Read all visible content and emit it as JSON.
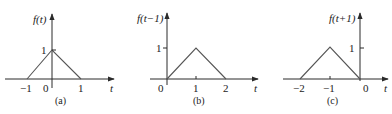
{
  "panels": [
    {
      "id": "a",
      "function_label": "f(t)",
      "axis_variable": "t",
      "caption": "(a)",
      "x_ticks": [
        "−1",
        "0",
        "1"
      ],
      "y_ticks": [
        "1"
      ],
      "vertices": [
        [
          -1,
          0
        ],
        [
          0,
          1
        ],
        [
          1,
          0
        ]
      ]
    },
    {
      "id": "b",
      "function_label": "f(t−1)",
      "axis_variable": "t",
      "caption": "(b)",
      "x_ticks": [
        "0",
        "1",
        "2"
      ],
      "y_ticks": [
        "1"
      ],
      "vertices": [
        [
          0,
          0
        ],
        [
          1,
          1
        ],
        [
          2,
          0
        ]
      ]
    },
    {
      "id": "c",
      "function_label": "f(t+1)",
      "axis_variable": "t",
      "caption": "(c)",
      "x_ticks": [
        "−2",
        "−1",
        "0"
      ],
      "y_ticks": [
        "1"
      ],
      "vertices": [
        [
          -2,
          0
        ],
        [
          -1,
          1
        ],
        [
          0,
          0
        ]
      ]
    }
  ]
}
